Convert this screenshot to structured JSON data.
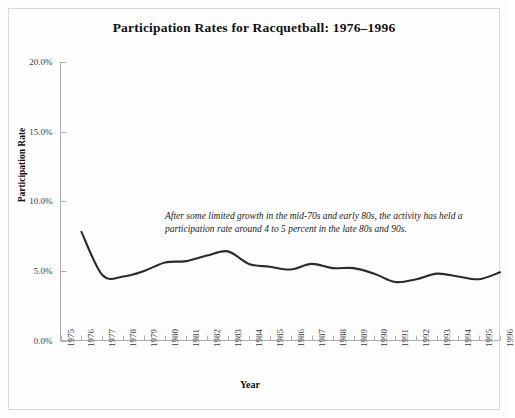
{
  "figure": {
    "title": "Participation Rates for Racquetball: 1976–1996",
    "annotation": "After some limited growth in the mid-70s and early 80s, the activity has held a participation rate around 4 to 5 percent in the late 80s and 90s.",
    "background_color": "#fdfdfd",
    "border_color": "#d8d8d8",
    "line_color": "#2b2b2b",
    "axis_color": "#9a9a9a",
    "text_color": "#101010"
  },
  "chart_data": {
    "type": "line",
    "title": "Participation Rates for Racquetball: 1976–1996",
    "xlabel": "Year",
    "ylabel": "Participation Rate",
    "xlim": [
      1975,
      1996
    ],
    "ylim": [
      0,
      20
    ],
    "grid": false,
    "legend": "none",
    "annotations": [
      {
        "text": "After some limited growth in the mid-70s and early 80s, the activity has held a participation rate around 4 to 5 percent in the late 80s and 90s.",
        "x": 1980,
        "y": 9.0
      }
    ],
    "x_tick_labels": [
      "1975",
      "1976",
      "1977",
      "1978",
      "1979",
      "1980",
      "1981",
      "1982",
      "1983",
      "1984",
      "1985",
      "1986",
      "1987",
      "1988",
      "1989",
      "1990",
      "1991",
      "1992",
      "1993",
      "1994",
      "1995",
      "1996"
    ],
    "y_tick_labels": [
      "0.0%",
      "5.0%",
      "10.0%",
      "15.0%",
      "20.0%"
    ],
    "y_tick_values": [
      0,
      5,
      10,
      15,
      20
    ],
    "series": [
      {
        "name": "Racquetball participation rate",
        "x": [
          1976,
          1977,
          1978,
          1979,
          1980,
          1981,
          1982,
          1983,
          1984,
          1985,
          1986,
          1987,
          1988,
          1989,
          1990,
          1991,
          1992,
          1993,
          1994,
          1995,
          1996
        ],
        "values": [
          7.8,
          4.7,
          4.6,
          5.0,
          5.6,
          5.7,
          6.1,
          6.4,
          5.5,
          5.3,
          5.1,
          5.5,
          5.2,
          5.2,
          4.8,
          4.2,
          4.4,
          4.8,
          4.6,
          4.4,
          4.9
        ],
        "units": "percent"
      }
    ]
  }
}
